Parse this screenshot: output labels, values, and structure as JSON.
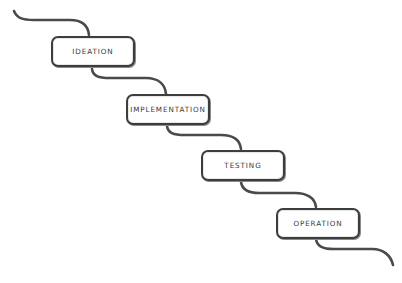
{
  "diagram": {
    "type": "waterfall-process",
    "stages": [
      {
        "label": "IDEATION"
      },
      {
        "label": "IMPLEMENTATION"
      },
      {
        "label": "TESTING"
      },
      {
        "label": "OPERATION"
      }
    ],
    "colors": {
      "ribbon": "#4a4a4a",
      "box_border": "#3d3d3d",
      "text": "#3a3a3a",
      "background": "#ffffff"
    }
  }
}
